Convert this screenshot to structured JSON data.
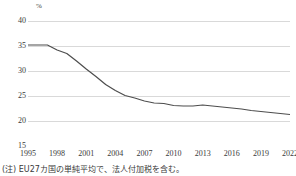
{
  "footnote": "(注) EU27カ国の単純平均で、法人付加税を含む。",
  "chart_data": {
    "type": "line",
    "title": "",
    "subtitle": "",
    "xlabel": "",
    "ylabel": "",
    "unit_label": "%",
    "ylim": [
      15,
      40
    ],
    "xlim": [
      1995,
      2022
    ],
    "grid": true,
    "grid_axis": "y",
    "legend": false,
    "legend_position": "none",
    "line_color": "#4d4d4d",
    "grid_color": "#d9d9d9",
    "y_ticks": [
      15,
      20,
      25,
      30,
      35,
      40
    ],
    "y_tick_labels": [
      "15",
      "20",
      "25",
      "30",
      "35",
      "40"
    ],
    "x_ticks": [
      1995,
      1998,
      2001,
      2004,
      2007,
      2010,
      2013,
      2016,
      2019,
      2022
    ],
    "x_tick_labels": [
      "1995",
      "1998",
      "2001",
      "2004",
      "2007",
      "2010",
      "2013",
      "2016",
      "2019",
      "2022"
    ],
    "x": [
      1995,
      1996,
      1997,
      1998,
      1999,
      2000,
      2001,
      2002,
      2003,
      2004,
      2005,
      2006,
      2007,
      2008,
      2009,
      2010,
      2011,
      2012,
      2013,
      2014,
      2015,
      2016,
      2017,
      2018,
      2019,
      2020,
      2021,
      2022
    ],
    "values": [
      35.2,
      35.2,
      35.2,
      34.2,
      33.5,
      32.0,
      30.4,
      28.9,
      27.3,
      26.1,
      25.1,
      24.6,
      24.0,
      23.6,
      23.5,
      23.1,
      23.0,
      23.0,
      23.2,
      23.0,
      22.8,
      22.6,
      22.4,
      22.1,
      21.9,
      21.7,
      21.5,
      21.3
    ],
    "series_name": "EU27 average corporate tax rate",
    "annotations": []
  }
}
